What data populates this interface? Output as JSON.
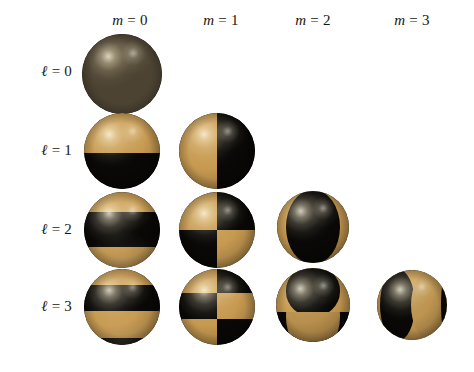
{
  "figure": {
    "background_color": "#ffffff",
    "colors": {
      "positive_lobe_gold": "#c79a51",
      "negative_lobe_black": "#090806",
      "monopole_bronze": "#4c4332",
      "text": "#18160f"
    },
    "column_headers": [
      {
        "symbol": "m",
        "relation": "=",
        "value": "0",
        "label": "m = 0",
        "center_x": 130
      },
      {
        "symbol": "m",
        "relation": "=",
        "value": "1",
        "label": "m = 1",
        "center_x": 221
      },
      {
        "symbol": "m",
        "relation": "=",
        "value": "2",
        "label": "m = 2",
        "center_x": 313
      },
      {
        "symbol": "m",
        "relation": "=",
        "value": "3",
        "label": "m = 3",
        "center_x": 412
      }
    ],
    "row_headers": [
      {
        "symbol": "ℓ",
        "relation": "=",
        "value": "0",
        "label": "ℓ = 0",
        "center_y": 71
      },
      {
        "symbol": "ℓ",
        "relation": "=",
        "value": "1",
        "label": "ℓ = 1",
        "center_y": 150
      },
      {
        "symbol": "ℓ",
        "relation": "=",
        "value": "2",
        "label": "ℓ = 2",
        "center_y": 229
      },
      {
        "symbol": "ℓ",
        "relation": "=",
        "value": "3",
        "label": "ℓ = 3",
        "center_y": 306
      }
    ],
    "spheres": [
      {
        "id": "Y-0-0",
        "l": 0,
        "m": 0,
        "name": "sphere-l0-m0",
        "cx": 122,
        "cy": 74,
        "d": 80,
        "pattern": "uniform-bronze",
        "description": "monopole, no nodal lines, uniform dark bronze",
        "nodal_lines": {
          "polar": 0,
          "azimuthal": 0
        }
      },
      {
        "id": "Y-1-0",
        "l": 1,
        "m": 0,
        "name": "sphere-l1-m0",
        "cx": 122,
        "cy": 151,
        "d": 76,
        "pattern": "bands-h-2",
        "bands": [
          "gold",
          "black"
        ],
        "description": "one horizontal nodal circle at equator",
        "nodal_lines": {
          "polar": 1,
          "azimuthal": 0
        }
      },
      {
        "id": "Y-1-1",
        "l": 1,
        "m": 1,
        "name": "sphere-l1-m1",
        "cx": 217,
        "cy": 151,
        "d": 76,
        "pattern": "lunes-v-2",
        "lunes": [
          "gold",
          "black"
        ],
        "description": "one vertical nodal meridian",
        "nodal_lines": {
          "polar": 0,
          "azimuthal": 1
        }
      },
      {
        "id": "Y-2-0",
        "l": 2,
        "m": 0,
        "name": "sphere-l2-m0",
        "cx": 122,
        "cy": 230,
        "d": 76,
        "pattern": "bands-h-3",
        "bands": [
          "gold",
          "black",
          "gold"
        ],
        "description": "two horizontal nodal circles",
        "nodal_lines": {
          "polar": 2,
          "azimuthal": 0
        }
      },
      {
        "id": "Y-2-1",
        "l": 2,
        "m": 1,
        "name": "sphere-l2-m1",
        "cx": 217,
        "cy": 230,
        "d": 76,
        "pattern": "checker-2x2",
        "cells": [
          [
            "gold",
            "black"
          ],
          [
            "black",
            "gold"
          ]
        ],
        "description": "one horizontal circle and one vertical meridian",
        "nodal_lines": {
          "polar": 1,
          "azimuthal": 1
        }
      },
      {
        "id": "Y-2-2",
        "l": 2,
        "m": 2,
        "name": "sphere-l2-m2",
        "cx": 313,
        "cy": 227,
        "d": 72,
        "pattern": "lunes-v-4",
        "lunes": [
          "gold",
          "black",
          "black",
          "gold"
        ],
        "description": "two vertical nodal meridians, central black lobe",
        "nodal_lines": {
          "polar": 0,
          "azimuthal": 2
        }
      },
      {
        "id": "Y-3-0",
        "l": 3,
        "m": 0,
        "name": "sphere-l3-m0",
        "cx": 122,
        "cy": 307,
        "d": 76,
        "pattern": "bands-h-4",
        "bands": [
          "gold",
          "black",
          "gold",
          "black"
        ],
        "description": "three horizontal nodal circles",
        "nodal_lines": {
          "polar": 3,
          "azimuthal": 0
        }
      },
      {
        "id": "Y-3-1",
        "l": 3,
        "m": 1,
        "name": "sphere-l3-m1",
        "cx": 217,
        "cy": 307,
        "d": 76,
        "pattern": "checker-2x3",
        "cells": [
          [
            "gold",
            "black"
          ],
          [
            "black",
            "gold"
          ],
          [
            "gold",
            "black"
          ]
        ],
        "description": "two horizontal circles and one vertical meridian",
        "nodal_lines": {
          "polar": 2,
          "azimuthal": 1
        }
      },
      {
        "id": "Y-3-2",
        "l": 3,
        "m": 2,
        "name": "sphere-l3-m2",
        "cx": 313,
        "cy": 305,
        "d": 74,
        "pattern": "lunes-v-4-split-h",
        "lunes_top": [
          "gold",
          "black",
          "black",
          "gold"
        ],
        "lunes_bottom": [
          "black",
          "gold",
          "gold",
          "black"
        ],
        "description": "two vertical meridians plus one horizontal circle",
        "nodal_lines": {
          "polar": 1,
          "azimuthal": 2
        }
      },
      {
        "id": "Y-3-3",
        "l": 3,
        "m": 3,
        "name": "sphere-l3-m3",
        "cx": 412,
        "cy": 305,
        "d": 70,
        "pattern": "lunes-v-6",
        "lunes": [
          "gold",
          "black",
          "black",
          "gold",
          "gold",
          "black"
        ],
        "description": "three vertical nodal meridians",
        "nodal_lines": {
          "polar": 0,
          "azimuthal": 3
        }
      }
    ]
  }
}
